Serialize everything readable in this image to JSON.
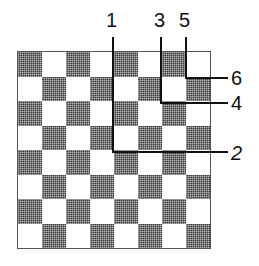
{
  "figure": {
    "board": {
      "rows": 8,
      "cols": 8,
      "top_left_color": "dark",
      "colors": {
        "dark": "#3a3a3a",
        "light": "#ffffff",
        "line": "#111111"
      }
    },
    "cut_lines": [
      {
        "label": "1",
        "orientation": "vertical",
        "x": 113,
        "y1": 37,
        "y2": 152
      },
      {
        "label": "2",
        "orientation": "horizontal",
        "y": 152,
        "x1": 113,
        "x2": 228
      },
      {
        "label": "3",
        "orientation": "vertical",
        "x": 161,
        "y1": 37,
        "y2": 103
      },
      {
        "label": "4",
        "orientation": "horizontal",
        "y": 103,
        "x1": 161,
        "x2": 228
      },
      {
        "label": "5",
        "orientation": "vertical",
        "x": 186,
        "y1": 37,
        "y2": 78
      },
      {
        "label": "6",
        "orientation": "horizontal",
        "y": 78,
        "x1": 186,
        "x2": 228
      }
    ],
    "labels": {
      "l1": "1",
      "l2": "2",
      "l3": "3",
      "l4": "4",
      "l5": "5",
      "l6": "6"
    }
  }
}
